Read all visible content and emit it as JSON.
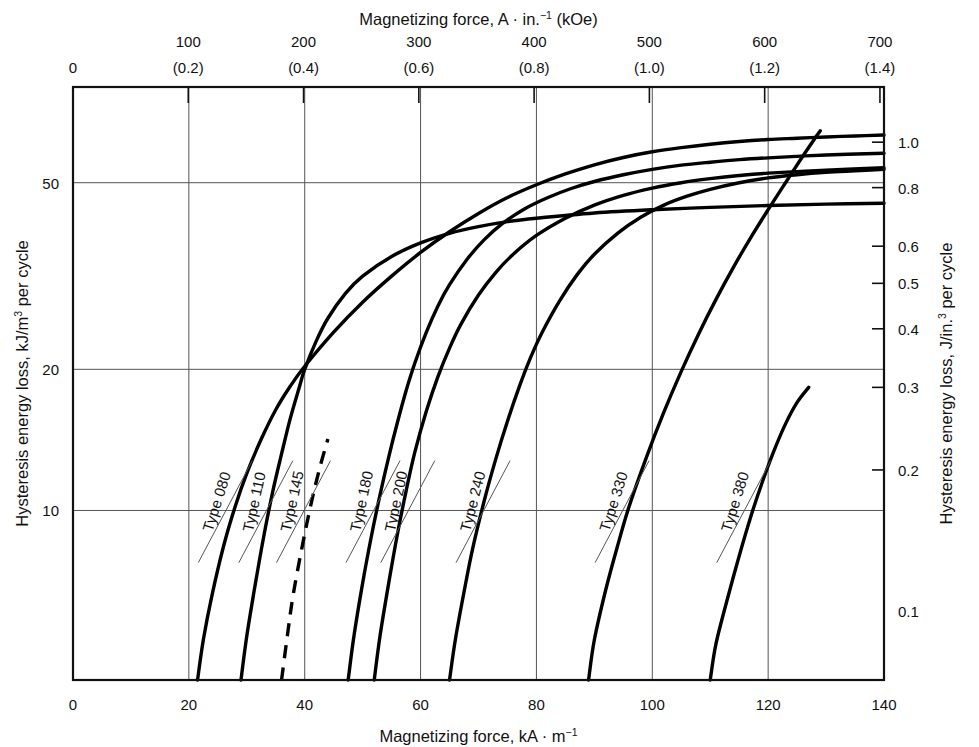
{
  "chart_data": {
    "type": "line",
    "title": "",
    "xlabel": "Magnetizing force, kA · m",
    "xlabel_sup": "−1",
    "ylabel": "Hysteresis energy loss, kJ/m",
    "ylabel_sup": "3",
    "ylabel_tail": " per cycle",
    "xlabel_top": "Magnetizing force, A · in.",
    "xlabel_top_sup": "−1",
    "xlabel_top_tail": " (kOe)",
    "ylabel_right": "Hysteresis energy loss, J/in.",
    "ylabel_right_sup": "3",
    "ylabel_right_tail": " per cycle",
    "xscale": "linear",
    "yscale": "log",
    "xlim": [
      0,
      140
    ],
    "ylim": [
      4.35,
      80
    ],
    "grid": true,
    "legend_position": "inline-curve-labels",
    "x_ticks": [
      {
        "value": 0,
        "label": "0",
        "grid": false
      },
      {
        "value": 20,
        "label": "20",
        "grid": true
      },
      {
        "value": 40,
        "label": "40",
        "grid": true
      },
      {
        "value": 60,
        "label": "60",
        "grid": true
      },
      {
        "value": 80,
        "label": "80",
        "grid": true
      },
      {
        "value": 100,
        "label": "100",
        "grid": true
      },
      {
        "value": 120,
        "label": "120",
        "grid": true
      },
      {
        "value": 140,
        "label": "140",
        "grid": false
      }
    ],
    "x_ticks_top": [
      {
        "value": 0,
        "label_a": "",
        "label_b": "0",
        "grid": false,
        "tick": false
      },
      {
        "value": 19.9,
        "label_a": "100",
        "label_b": "(0.2)",
        "grid": false,
        "tick": true
      },
      {
        "value": 39.8,
        "label_a": "200",
        "label_b": "(0.4)",
        "grid": false,
        "tick": true
      },
      {
        "value": 59.7,
        "label_a": "300",
        "label_b": "(0.6)",
        "grid": false,
        "tick": true
      },
      {
        "value": 79.6,
        "label_a": "400",
        "label_b": "(0.8)",
        "grid": false,
        "tick": true
      },
      {
        "value": 99.5,
        "label_a": "500",
        "label_b": "(1.0)",
        "grid": false,
        "tick": true
      },
      {
        "value": 119.4,
        "label_a": "600",
        "label_b": "(1.2)",
        "grid": false,
        "tick": true
      },
      {
        "value": 139.3,
        "label_a": "700",
        "label_b": "(1.4)",
        "grid": false,
        "tick": true
      },
      {
        "value": 159.2,
        "label_a": "800",
        "label_b": "(1.6)",
        "grid": false,
        "tick": true
      }
    ],
    "y_ticks_left": [
      {
        "value": 50,
        "label": "50",
        "grid": true
      },
      {
        "value": 20,
        "label": "20",
        "grid": true
      },
      {
        "value": 10,
        "label": "10",
        "grid": true
      }
    ],
    "y_ticks_right": [
      {
        "value": 1.0,
        "label": "1.0"
      },
      {
        "value": 0.8,
        "label": "0.8"
      },
      {
        "value": 0.6,
        "label": "0.6"
      },
      {
        "value": 0.5,
        "label": "0.5"
      },
      {
        "value": 0.4,
        "label": "0.4"
      },
      {
        "value": 0.3,
        "label": "0.3"
      },
      {
        "value": 0.2,
        "label": "0.2"
      },
      {
        "value": 0.1,
        "label": "0.1"
      }
    ],
    "right_axis_unit_factor": 0.01639,
    "series": [
      {
        "name": "Type 080",
        "label": "Type 080",
        "style": "solid",
        "label_x": 27.5,
        "label_y": 10.6,
        "points": [
          [
            21.5,
            4.35
          ],
          [
            22.5,
            5.3
          ],
          [
            24,
            6.6
          ],
          [
            26,
            8.4
          ],
          [
            28,
            10.2
          ],
          [
            30,
            12.0
          ],
          [
            32.5,
            14.2
          ],
          [
            35,
            16.4
          ],
          [
            37.5,
            18.4
          ],
          [
            40,
            20.3
          ],
          [
            45,
            24.0
          ],
          [
            50,
            27.8
          ],
          [
            55,
            31.6
          ],
          [
            60,
            35.5
          ],
          [
            65,
            39.3
          ],
          [
            70,
            43.0
          ],
          [
            75,
            46.5
          ],
          [
            80,
            49.5
          ],
          [
            85,
            52.2
          ],
          [
            90,
            54.6
          ],
          [
            95,
            56.6
          ],
          [
            100,
            58.2
          ],
          [
            105,
            59.4
          ],
          [
            110,
            60.4
          ],
          [
            115,
            61.2
          ],
          [
            120,
            61.8
          ],
          [
            125,
            62.2
          ],
          [
            130,
            62.6
          ],
          [
            135,
            62.9
          ],
          [
            140,
            63.2
          ]
        ]
      },
      {
        "name": "Type 110",
        "label": "Type 110",
        "style": "solid",
        "label_x": 34.5,
        "label_y": 10.6,
        "points": [
          [
            29,
            4.35
          ],
          [
            30,
            5.4
          ],
          [
            31.5,
            7.0
          ],
          [
            33,
            8.9
          ],
          [
            34.5,
            11.0
          ],
          [
            36,
            13.2
          ],
          [
            37.5,
            15.7
          ],
          [
            39,
            18.2
          ],
          [
            40,
            20.0
          ],
          [
            42,
            23.0
          ],
          [
            44,
            25.7
          ],
          [
            47,
            29.0
          ],
          [
            50,
            31.6
          ],
          [
            55,
            34.8
          ],
          [
            60,
            37.2
          ],
          [
            65,
            39.0
          ],
          [
            70,
            40.3
          ],
          [
            75,
            41.3
          ],
          [
            80,
            42.0
          ],
          [
            90,
            43.1
          ],
          [
            100,
            43.8
          ],
          [
            110,
            44.3
          ],
          [
            120,
            44.7
          ],
          [
            130,
            45.0
          ],
          [
            140,
            45.2
          ]
        ]
      },
      {
        "name": "Type 145",
        "label": "Type 145",
        "style": "dashed",
        "label_x": 41,
        "label_y": 10.6,
        "points": [
          [
            36,
            4.35
          ],
          [
            37,
            5.4
          ],
          [
            38,
            6.6
          ],
          [
            39.5,
            8.3
          ],
          [
            41,
            10.2
          ],
          [
            42.5,
            12.2
          ],
          [
            44,
            14.2
          ]
        ]
      },
      {
        "name": "Type 180",
        "label": "Type 180",
        "style": "solid",
        "label_x": 53,
        "label_y": 10.6,
        "points": [
          [
            47.5,
            4.35
          ],
          [
            48.5,
            5.4
          ],
          [
            50,
            7.0
          ],
          [
            51.5,
            8.8
          ],
          [
            53,
            10.8
          ],
          [
            54.5,
            13.0
          ],
          [
            56,
            15.4
          ],
          [
            57.5,
            18.0
          ],
          [
            59,
            20.6
          ],
          [
            61,
            24.0
          ],
          [
            63,
            27.3
          ],
          [
            65,
            30.3
          ],
          [
            68,
            34.3
          ],
          [
            71,
            37.8
          ],
          [
            74,
            40.8
          ],
          [
            78,
            44.0
          ],
          [
            82,
            46.5
          ],
          [
            86,
            48.6
          ],
          [
            90,
            50.3
          ],
          [
            95,
            52.0
          ],
          [
            100,
            53.4
          ],
          [
            105,
            54.5
          ],
          [
            110,
            55.3
          ],
          [
            115,
            56.0
          ],
          [
            120,
            56.5
          ],
          [
            130,
            57.3
          ],
          [
            140,
            57.8
          ]
        ]
      },
      {
        "name": "Type 200",
        "label": "Type 200",
        "style": "solid",
        "label_x": 59,
        "label_y": 10.6,
        "points": [
          [
            52,
            4.35
          ],
          [
            53,
            5.4
          ],
          [
            54.5,
            7.0
          ],
          [
            56,
            8.9
          ],
          [
            57.5,
            11.0
          ],
          [
            59,
            13.3
          ],
          [
            61,
            16.3
          ],
          [
            63,
            19.3
          ],
          [
            65,
            22.2
          ],
          [
            67,
            25.0
          ],
          [
            70,
            28.8
          ],
          [
            73,
            32.2
          ],
          [
            76,
            35.2
          ],
          [
            80,
            38.6
          ],
          [
            85,
            42.0
          ],
          [
            90,
            44.8
          ],
          [
            95,
            47.0
          ],
          [
            100,
            48.7
          ],
          [
            105,
            50.0
          ],
          [
            110,
            51.0
          ],
          [
            115,
            51.8
          ],
          [
            120,
            52.4
          ],
          [
            130,
            53.2
          ],
          [
            140,
            53.8
          ]
        ]
      },
      {
        "name": "Type 240",
        "label": "Type 240",
        "style": "solid",
        "label_x": 72,
        "label_y": 10.6,
        "points": [
          [
            65,
            4.35
          ],
          [
            66,
            5.3
          ],
          [
            67.5,
            6.7
          ],
          [
            69,
            8.3
          ],
          [
            71,
            10.5
          ],
          [
            73,
            12.9
          ],
          [
            75,
            15.5
          ],
          [
            77,
            18.3
          ],
          [
            79,
            21.2
          ],
          [
            81,
            24.0
          ],
          [
            84,
            28.0
          ],
          [
            87,
            31.8
          ],
          [
            90,
            35.2
          ],
          [
            94,
            39.0
          ],
          [
            98,
            42.2
          ],
          [
            102,
            44.8
          ],
          [
            106,
            46.8
          ],
          [
            110,
            48.4
          ],
          [
            115,
            50.0
          ],
          [
            120,
            51.2
          ],
          [
            125,
            52.0
          ],
          [
            130,
            52.6
          ],
          [
            135,
            53.0
          ],
          [
            140,
            53.4
          ]
        ]
      },
      {
        "name": "Type 330",
        "label": "Type 330",
        "style": "solid",
        "label_x": 96,
        "label_y": 10.6,
        "points": [
          [
            89,
            4.35
          ],
          [
            90,
            5.3
          ],
          [
            92,
            6.8
          ],
          [
            94,
            8.4
          ],
          [
            96,
            10.2
          ],
          [
            99,
            13.0
          ],
          [
            102,
            16.2
          ],
          [
            105,
            19.8
          ],
          [
            108,
            23.8
          ],
          [
            111,
            28.2
          ],
          [
            114,
            33.0
          ],
          [
            117,
            38.2
          ],
          [
            120,
            43.8
          ],
          [
            123,
            50.0
          ],
          [
            126,
            57.0
          ],
          [
            128,
            62.0
          ],
          [
            129,
            64.5
          ]
        ]
      },
      {
        "name": "Type 380",
        "label": "Type 380",
        "style": "solid",
        "label_x": 117,
        "label_y": 10.6,
        "points": [
          [
            110,
            4.35
          ],
          [
            111,
            5.2
          ],
          [
            113,
            6.5
          ],
          [
            115,
            8.0
          ],
          [
            117,
            9.7
          ],
          [
            119,
            11.5
          ],
          [
            121,
            13.4
          ],
          [
            123,
            15.3
          ],
          [
            125,
            17.0
          ],
          [
            127,
            18.3
          ]
        ]
      }
    ]
  }
}
